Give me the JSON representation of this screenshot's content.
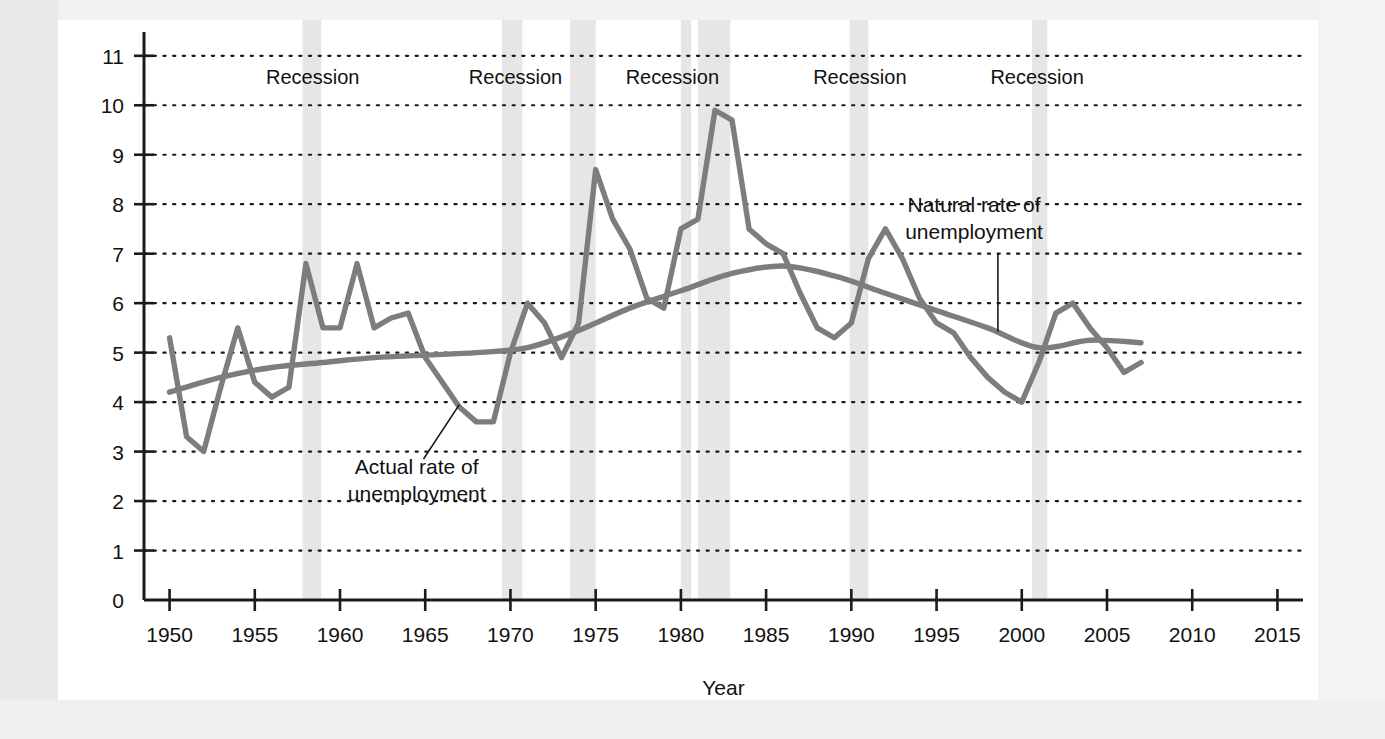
{
  "figure": {
    "background_color": "#ffffff",
    "page_backdrop_color": "#e9e9e9"
  },
  "chart_data": {
    "type": "line",
    "title": "",
    "xlabel": "Year",
    "ylabel": "",
    "xlim": [
      1948.5,
      2016.5
    ],
    "ylim": [
      0,
      11.4
    ],
    "grid": "horizontal-dotted",
    "legend": "none",
    "line_color": "#7d7d7d",
    "xticks": [
      1950,
      1955,
      1960,
      1965,
      1970,
      1975,
      1980,
      1985,
      1990,
      1995,
      2000,
      2005,
      2010,
      2015
    ],
    "xtick_labels": [
      "1950",
      "1955",
      "1960",
      "1965",
      "1970",
      "1975",
      "1980",
      "1985",
      "1990",
      "1995",
      "2000",
      "2005",
      "2010",
      "2015"
    ],
    "yticks": [
      0,
      1,
      2,
      3,
      4,
      5,
      6,
      7,
      8,
      9,
      10,
      11
    ],
    "ytick_labels": [
      "0",
      "1",
      "2",
      "3",
      "4",
      "5",
      "6",
      "7",
      "8",
      "9",
      "10",
      "11"
    ],
    "series": [
      {
        "name": "Actual rate of unemployment",
        "x": [
          1950,
          1951,
          1952,
          1953,
          1954,
          1955,
          1956,
          1957,
          1958,
          1959,
          1960,
          1961,
          1962,
          1963,
          1964,
          1965,
          1966,
          1967,
          1968,
          1969,
          1970,
          1971,
          1972,
          1973,
          1974,
          1975,
          1976,
          1977,
          1978,
          1979,
          1980,
          1981,
          1982,
          1983,
          1984,
          1985,
          1986,
          1987,
          1988,
          1989,
          1990,
          1991,
          1992,
          1993,
          1994,
          1995,
          1996,
          1997,
          1998,
          1999,
          2000,
          2001,
          2002,
          2003,
          2004,
          2005,
          2006,
          2007
        ],
        "values": [
          5.3,
          3.3,
          3.0,
          4.3,
          5.5,
          4.4,
          4.1,
          4.3,
          6.8,
          5.5,
          5.5,
          6.8,
          5.5,
          5.7,
          5.8,
          4.9,
          4.4,
          3.9,
          3.6,
          3.6,
          5.0,
          6.0,
          5.6,
          4.9,
          5.6,
          8.7,
          7.7,
          7.1,
          6.1,
          5.9,
          7.5,
          7.7,
          9.9,
          9.7,
          7.5,
          7.2,
          7.0,
          6.2,
          5.5,
          5.3,
          5.6,
          6.9,
          7.5,
          6.9,
          6.1,
          5.6,
          5.4,
          4.9,
          4.5,
          4.2,
          4.0,
          4.8,
          5.8,
          6.0,
          5.5,
          5.1,
          4.6,
          4.8
        ],
        "style": "jagged-line"
      },
      {
        "name": "Natural rate of unemployment",
        "x": [
          1950,
          1953,
          1956,
          1959,
          1962,
          1965,
          1968,
          1971,
          1974,
          1977,
          1980,
          1983,
          1986,
          1989,
          1992,
          1995,
          1998,
          2001,
          2004,
          2007
        ],
        "values": [
          4.2,
          4.5,
          4.7,
          4.8,
          4.9,
          4.95,
          5.0,
          5.1,
          5.45,
          5.9,
          6.25,
          6.6,
          6.75,
          6.55,
          6.2,
          5.85,
          5.5,
          5.1,
          5.25,
          5.2
        ],
        "style": "smooth-curve"
      }
    ],
    "shaded_regions": [
      {
        "label": "Recession",
        "start_year": 1957.8,
        "end_year": 1958.9
      },
      {
        "label": "Recession",
        "start_year": 1969.5,
        "end_year": 1970.7
      },
      {
        "label": "Recession",
        "start_year": 1973.5,
        "end_year": 1975.0
      },
      {
        "label": "Recession",
        "start_year": 1980.0,
        "end_year": 1980.6
      },
      {
        "label": "Recession",
        "start_year": 1981.0,
        "end_year": 1982.9
      },
      {
        "label": "Recession",
        "start_year": 1989.9,
        "end_year": 1991.0
      },
      {
        "label": "Recession",
        "start_year": 2000.6,
        "end_year": 2001.5
      }
    ],
    "shaded_region_color": "#e6e6e6",
    "recession_labels": [
      {
        "text": "Recession",
        "year": 1958.4
      },
      {
        "text": "Recession",
        "year": 1970.3
      },
      {
        "text": "Recession",
        "year": 1979.5
      },
      {
        "text": "Recession",
        "year": 1990.5
      },
      {
        "text": "Recession",
        "year": 2000.9
      }
    ],
    "annotations": [
      {
        "id": "actual-rate-annotation",
        "lines": [
          "Actual rate of",
          "unemployment"
        ],
        "text_year": 1964.5,
        "text_value": 2.55,
        "leader_from_year": 1964.9,
        "leader_from_value": 2.85,
        "leader_to_year": 1967.0,
        "leader_to_value": 3.95
      },
      {
        "id": "natural-rate-annotation",
        "lines": [
          "Natural rate of",
          "unemployment"
        ],
        "text_year": 1997.2,
        "text_value": 7.85,
        "leader_from_year": 1998.6,
        "leader_from_value": 7.0,
        "leader_to_year": 1998.6,
        "leader_to_value": 5.42
      }
    ]
  }
}
